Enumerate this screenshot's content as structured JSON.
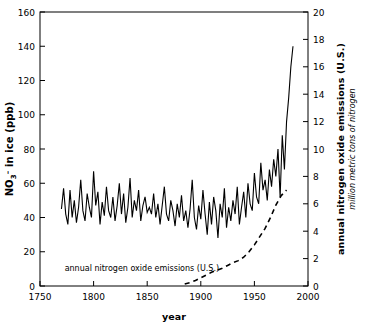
{
  "chart_data": {
    "type": "line",
    "title": "",
    "xlabel": "year",
    "ylabel_left": "NO₃⁻ in ice (ppb)",
    "ylabel_right": "annual nitrogen oxide emissions (U.S.)",
    "ylabel_right_sub": "million metric tons of nitrogen",
    "xlim": [
      1750,
      2000
    ],
    "ylim_left": [
      0,
      160
    ],
    "ylim_right": [
      0,
      20
    ],
    "xticks": [
      1750,
      1800,
      1850,
      1900,
      1950,
      2000
    ],
    "xticklabels": [
      "1750",
      "1800",
      "1850",
      "1900",
      "1950",
      "2000"
    ],
    "yticks_left": [
      0,
      20,
      40,
      60,
      80,
      100,
      120,
      140,
      160
    ],
    "yticklabels_left": [
      "0",
      "20",
      "40",
      "60",
      "80",
      "100",
      "120",
      "140",
      "160"
    ],
    "yticks_right": [
      0,
      2,
      4,
      6,
      8,
      10,
      12,
      14,
      16,
      18,
      20
    ],
    "yticklabels_right": [
      "0",
      "2",
      "4",
      "6",
      "8",
      "10",
      "12",
      "14",
      "16",
      "18",
      "20"
    ],
    "grid": false,
    "legend": "none",
    "annotations": [
      {
        "text": "annual nitrogen oxide emissions (U.S.)",
        "x": 1845,
        "y": 9,
        "axis": "left",
        "style": "plain"
      }
    ],
    "series": [
      {
        "name": "NO3- in ice (ppb)",
        "axis": "left",
        "style": "solid",
        "color": "#000000",
        "x": [
          1770,
          1772,
          1774,
          1776,
          1778,
          1780,
          1782,
          1784,
          1786,
          1788,
          1790,
          1792,
          1794,
          1796,
          1798,
          1800,
          1802,
          1804,
          1806,
          1808,
          1810,
          1812,
          1814,
          1816,
          1818,
          1820,
          1822,
          1824,
          1826,
          1828,
          1830,
          1832,
          1834,
          1836,
          1838,
          1840,
          1842,
          1844,
          1846,
          1848,
          1850,
          1852,
          1854,
          1856,
          1858,
          1860,
          1862,
          1864,
          1866,
          1868,
          1870,
          1872,
          1874,
          1876,
          1878,
          1880,
          1882,
          1884,
          1886,
          1888,
          1890,
          1892,
          1894,
          1896,
          1898,
          1900,
          1902,
          1904,
          1906,
          1908,
          1910,
          1912,
          1914,
          1916,
          1918,
          1920,
          1922,
          1924,
          1926,
          1928,
          1930,
          1932,
          1934,
          1936,
          1938,
          1940,
          1942,
          1944,
          1946,
          1948,
          1950,
          1952,
          1954,
          1956,
          1958,
          1960,
          1962,
          1964,
          1966,
          1968,
          1970,
          1972,
          1974,
          1976,
          1978,
          1980,
          1982,
          1984,
          1986
        ],
        "values": [
          45,
          57,
          42,
          36,
          56,
          40,
          50,
          37,
          46,
          62,
          44,
          38,
          54,
          46,
          40,
          67,
          47,
          55,
          36,
          49,
          41,
          58,
          44,
          40,
          52,
          38,
          47,
          60,
          42,
          54,
          37,
          46,
          63,
          40,
          50,
          44,
          56,
          38,
          47,
          52,
          43,
          46,
          42,
          54,
          40,
          48,
          36,
          47,
          58,
          42,
          38,
          50,
          44,
          35,
          48,
          40,
          53,
          38,
          44,
          34,
          45,
          62,
          40,
          33,
          47,
          39,
          56,
          42,
          30,
          49,
          36,
          52,
          44,
          28,
          48,
          40,
          57,
          34,
          46,
          38,
          50,
          42,
          58,
          36,
          46,
          55,
          40,
          60,
          48,
          44,
          66,
          52,
          48,
          72,
          56,
          62,
          50,
          68,
          58,
          74,
          64,
          80,
          52,
          88,
          68,
          96,
          110,
          128,
          140
        ]
      },
      {
        "name": "annual nitrogen oxide emissions (U.S.)",
        "axis": "right",
        "style": "dashed",
        "color": "#000000",
        "x": [
          1885,
          1890,
          1895,
          1900,
          1905,
          1910,
          1915,
          1920,
          1925,
          1930,
          1935,
          1940,
          1945,
          1950,
          1955,
          1960,
          1965,
          1970,
          1975,
          1980
        ],
        "values": [
          0.15,
          0.25,
          0.4,
          0.6,
          0.8,
          1.0,
          1.15,
          1.3,
          1.5,
          1.7,
          1.85,
          2.1,
          2.5,
          3.0,
          3.6,
          4.2,
          5.0,
          5.9,
          6.6,
          7.0
        ]
      }
    ]
  }
}
